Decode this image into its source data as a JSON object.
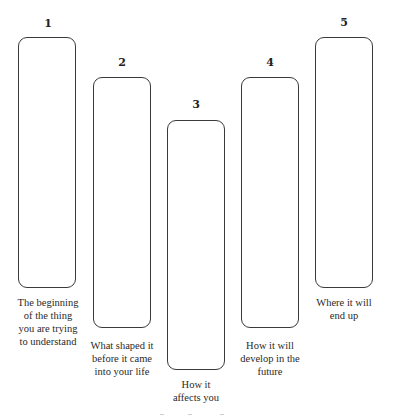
{
  "diagram": {
    "type": "five-stage column diagram",
    "stroke_color": "#3a3a3a",
    "steps": [
      {
        "number": "1",
        "label_lines": [
          "The beginning",
          "of the thing",
          "you are trying",
          "to understand"
        ]
      },
      {
        "number": "2",
        "label_lines": [
          "What shaped it",
          "before it came",
          "into your life"
        ]
      },
      {
        "number": "3",
        "label_lines": [
          "How it",
          "affects you"
        ]
      },
      {
        "number": "4",
        "label_lines": [
          "How it will",
          "develop in the",
          "future"
        ]
      },
      {
        "number": "5",
        "label_lines": [
          "Where it will",
          "end up"
        ]
      }
    ]
  }
}
